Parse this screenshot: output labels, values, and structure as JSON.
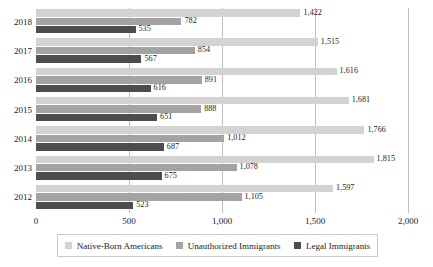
{
  "chart_data": {
    "type": "bar",
    "orientation": "horizontal",
    "title": "",
    "xlabel": "",
    "ylabel": "",
    "categories": [
      "2018",
      "2017",
      "2016",
      "2015",
      "2014",
      "2013",
      "2012"
    ],
    "series": [
      {
        "name": "Native-Born Americans",
        "color": "#d3d3d3",
        "values": [
          1422,
          1515,
          1616,
          1681,
          1766,
          1815,
          1597
        ],
        "labels": [
          "1,422",
          "1,515",
          "1,616",
          "1,681",
          "1,766",
          "1,815",
          "1,597"
        ]
      },
      {
        "name": "Unauthorized Immigrants",
        "color": "#a3a3a3",
        "values": [
          782,
          854,
          891,
          888,
          1012,
          1078,
          1105
        ],
        "labels": [
          "782",
          "854",
          "891",
          "888",
          "1,012",
          "1,078",
          "1,105"
        ]
      },
      {
        "name": "Legal Immigrants",
        "color": "#4d4d4d",
        "values": [
          535,
          567,
          616,
          651,
          687,
          675,
          523
        ],
        "labels": [
          "535",
          "567",
          "616",
          "651",
          "687",
          "675",
          "523"
        ]
      }
    ],
    "xlim": [
      0,
      2000
    ],
    "xticks": [
      0,
      500,
      1000,
      1500,
      2000
    ],
    "xtick_labels": [
      "0",
      "500",
      "1,000",
      "1,500",
      "2,000"
    ],
    "grid": "vertical",
    "legend_position": "bottom"
  },
  "legend": {
    "items": [
      {
        "label": "Native-Born Americans",
        "color": "#d3d3d3"
      },
      {
        "label": "Unauthorized Immigrants",
        "color": "#a3a3a3"
      },
      {
        "label": "Legal Immigrants",
        "color": "#4d4d4d"
      }
    ]
  }
}
